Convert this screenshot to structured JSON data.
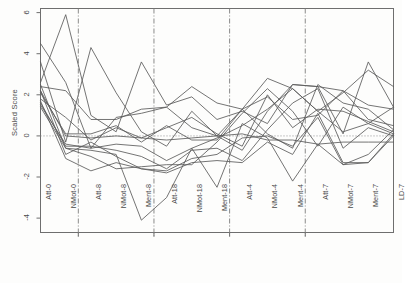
{
  "chart_data": {
    "type": "line",
    "title": "",
    "subtitle": "",
    "xlabel": "",
    "ylabel": "Scaled Score",
    "ylim": [
      -4.7,
      6.2
    ],
    "yticks": [
      6,
      4,
      2,
      0,
      -2,
      -4
    ],
    "ytick_labels": [
      "6",
      "4",
      "2",
      "0",
      "-2",
      "-4"
    ],
    "grid": false,
    "legend": "none",
    "reference_line": {
      "y": 0,
      "style": "dotted",
      "label": "0"
    },
    "group_separators": [
      "NMot-0",
      "Ment-8",
      "Ment-18",
      "Ment-4"
    ],
    "categories": [
      "Att-0",
      "NMot-0",
      "Att-8",
      "NMot-8",
      "Ment-8",
      "Att-18",
      "NMot-18",
      "Ment-18",
      "Att-4",
      "NMot-4",
      "Ment-4",
      "Att-7",
      "NMot-7",
      "Ment-7",
      "LD-7"
    ],
    "series": [
      {
        "name": "s1",
        "values": [
          4.5,
          2.6,
          -0.6,
          0.9,
          1.1,
          1.4,
          2.4,
          1.6,
          1.3,
          2.8,
          2.3,
          1.2,
          2.1,
          3.2,
          2.4
        ]
      },
      {
        "name": "s2",
        "values": [
          2.6,
          5.9,
          1.0,
          0.2,
          3.6,
          1.5,
          1.9,
          0.8,
          1.2,
          0.6,
          2.5,
          2.4,
          0.1,
          3.6,
          1.4
        ]
      },
      {
        "name": "s3",
        "values": [
          3.6,
          -0.3,
          4.3,
          2.1,
          0.2,
          -0.5,
          1.2,
          0.0,
          -0.7,
          1.2,
          2.5,
          2.4,
          2.2,
          1.5,
          1.3
        ]
      },
      {
        "name": "s4",
        "values": [
          2.4,
          2.2,
          0.8,
          0.8,
          1.3,
          1.4,
          0.4,
          0.0,
          1.3,
          1.9,
          0.8,
          1.0,
          2.2,
          0.8,
          0.5
        ]
      },
      {
        "name": "s5",
        "values": [
          2.1,
          0.1,
          0.1,
          0.5,
          -0.3,
          0.5,
          -0.2,
          -0.2,
          1.3,
          0.1,
          -0.6,
          2.5,
          1.6,
          1.3,
          0.3
        ]
      },
      {
        "name": "s6",
        "values": [
          1.8,
          0.9,
          -0.2,
          0.4,
          -0.1,
          0.4,
          0.9,
          0.1,
          -0.5,
          2.0,
          0.4,
          1.3,
          1.2,
          0.7,
          0.2
        ]
      },
      {
        "name": "s7",
        "values": [
          2.2,
          0.0,
          -0.1,
          0.0,
          -0.1,
          -0.2,
          -0.1,
          0.0,
          0.1,
          -0.2,
          -0.2,
          -0.4,
          -0.3,
          -0.3,
          -0.3
        ]
      },
      {
        "name": "s8",
        "values": [
          1.5,
          -0.4,
          -0.6,
          -0.4,
          -0.5,
          -1.2,
          -0.6,
          -0.1,
          0.5,
          1.3,
          2.3,
          1.2,
          0.2,
          0.6,
          0.1
        ]
      },
      {
        "name": "s9",
        "values": [
          1.6,
          -0.5,
          -0.5,
          -0.7,
          -1.0,
          -1.6,
          -0.7,
          -0.6,
          -1.2,
          0.3,
          1.6,
          2.3,
          -0.6,
          0.4,
          0.0
        ]
      },
      {
        "name": "s10",
        "values": [
          2.2,
          -0.9,
          -0.3,
          -1.0,
          -1.6,
          -1.7,
          -1.1,
          -0.9,
          -0.1,
          0.0,
          -0.5,
          0.9,
          -1.4,
          -0.9,
          0.3
        ]
      },
      {
        "name": "s11",
        "values": [
          1.7,
          -1.1,
          -1.7,
          -1.3,
          -1.6,
          -1.8,
          -1.3,
          -1.2,
          -1.3,
          -0.3,
          -0.9,
          1.1,
          -1.3,
          -1.3,
          0.1
        ]
      },
      {
        "name": "s12",
        "values": [
          2.5,
          -0.6,
          -0.7,
          -0.9,
          -4.1,
          -3.0,
          -0.6,
          -2.5,
          0.6,
          -0.1,
          -2.2,
          -0.4,
          -1.4,
          -1.3,
          0.0
        ]
      },
      {
        "name": "s13",
        "values": [
          1.4,
          -0.6,
          -1.0,
          -1.6,
          -1.5,
          -1.4,
          -1.4,
          -0.3,
          1.1,
          2.3,
          1.2,
          -0.5,
          1.4,
          0.6,
          1.4
        ]
      }
    ]
  },
  "axes": {
    "ylabel": "Scaled Score"
  }
}
